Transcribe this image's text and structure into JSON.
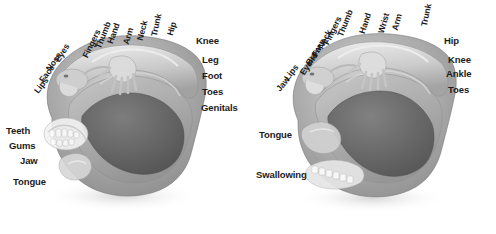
{
  "diagram": {
    "background_color": "#ffffff",
    "label_color": "#1b1b1b",
    "panels": [
      {
        "id": "sensory",
        "name": "sensory-homunculus",
        "rotated_labels": [
          {
            "text": "Lips",
            "x": 36,
            "y": 88,
            "angle": -52
          },
          {
            "text": "Face",
            "x": 41,
            "y": 77,
            "angle": -52
          },
          {
            "text": "Nose",
            "x": 48,
            "y": 66,
            "angle": -55
          },
          {
            "text": "Eyes",
            "x": 57,
            "y": 57,
            "angle": -58
          },
          {
            "text": "Fingers",
            "x": 85,
            "y": 53,
            "angle": -64
          },
          {
            "text": "Thumb",
            "x": 98,
            "y": 44,
            "angle": -68
          },
          {
            "text": "Hand",
            "x": 110,
            "y": 39,
            "angle": -70
          },
          {
            "text": "Arm",
            "x": 126,
            "y": 40,
            "angle": -74
          },
          {
            "text": "Neck",
            "x": 140,
            "y": 36,
            "angle": -76
          },
          {
            "text": "Trunk",
            "x": 154,
            "y": 32,
            "angle": -78
          },
          {
            "text": "Hip",
            "x": 170,
            "y": 31,
            "angle": -74
          }
        ],
        "horizontal_labels": [
          {
            "text": "Knee",
            "x": 196,
            "y": 36
          },
          {
            "text": "Leg",
            "x": 202,
            "y": 55
          },
          {
            "text": "Foot",
            "x": 202,
            "y": 71
          },
          {
            "text": "Toes",
            "x": 202,
            "y": 87
          },
          {
            "text": "Genitals",
            "x": 201,
            "y": 103
          },
          {
            "text": "Teeth",
            "x": 6,
            "y": 126
          },
          {
            "text": "Gums",
            "x": 9,
            "y": 141
          },
          {
            "text": "Jaw",
            "x": 20,
            "y": 156
          },
          {
            "text": "Tongue",
            "x": 13,
            "y": 177
          }
        ]
      },
      {
        "id": "motor",
        "name": "motor-homunculus",
        "rotated_labels": [
          {
            "text": "Jaw",
            "x": 30,
            "y": 86,
            "angle": -50
          },
          {
            "text": "Lips",
            "x": 38,
            "y": 75,
            "angle": -52
          },
          {
            "text": "Eyelid",
            "x": 54,
            "y": 70,
            "angle": -56
          },
          {
            "text": "Brow",
            "x": 60,
            "y": 60,
            "angle": -58
          },
          {
            "text": "Face",
            "x": 66,
            "y": 52,
            "angle": -60
          },
          {
            "text": "Neck",
            "x": 72,
            "y": 44,
            "angle": -62
          },
          {
            "text": "Fingers",
            "x": 78,
            "y": 40,
            "angle": -64
          },
          {
            "text": "Thumb",
            "x": 92,
            "y": 32,
            "angle": -68
          },
          {
            "text": "Hand",
            "x": 114,
            "y": 29,
            "angle": -72
          },
          {
            "text": "Wrist",
            "x": 133,
            "y": 29,
            "angle": -74
          },
          {
            "text": "Arm",
            "x": 147,
            "y": 26,
            "angle": -76
          },
          {
            "text": "Trunk",
            "x": 176,
            "y": 22,
            "angle": -78
          }
        ],
        "horizontal_labels": [
          {
            "text": "Hip",
            "x": 196,
            "y": 36
          },
          {
            "text": "Knee",
            "x": 200,
            "y": 55
          },
          {
            "text": "Ankle",
            "x": 198,
            "y": 69
          },
          {
            "text": "Toes",
            "x": 200,
            "y": 85
          },
          {
            "text": "Tongue",
            "x": 11,
            "y": 130
          },
          {
            "text": "Swallowing",
            "x": 8,
            "y": 170
          }
        ]
      }
    ]
  }
}
